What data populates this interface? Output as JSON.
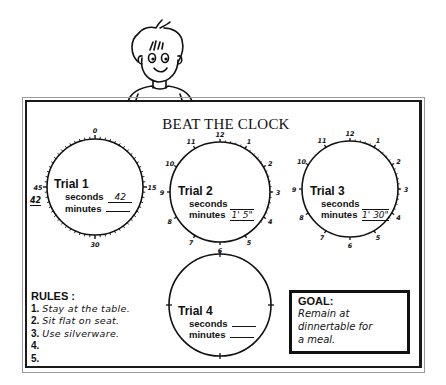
{
  "title": "BEAT THE CLOCK",
  "trials": [
    {
      "label": "Trial 1",
      "seconds_label": "seconds",
      "seconds_value": "42",
      "minutes_label": "minutes",
      "minutes_value": "",
      "face_numbers": [
        "0",
        "15",
        "30",
        "45"
      ],
      "annotation": "42"
    },
    {
      "label": "Trial 2",
      "seconds_label": "seconds",
      "seconds_value": "",
      "minutes_label": "minutes",
      "minutes_value": "1' 5\"",
      "face_numbers": [
        "12",
        "1",
        "2",
        "3",
        "4",
        "5",
        "6",
        "7",
        "8",
        "9",
        "10",
        "11"
      ]
    },
    {
      "label": "Trial 3",
      "seconds_label": "seconds",
      "seconds_value": "",
      "minutes_label": "minutes",
      "minutes_value": "1' 30\"",
      "face_numbers": [
        "12",
        "1",
        "2",
        "3",
        "4",
        "5",
        "6",
        "7",
        "8",
        "9",
        "10",
        "11"
      ]
    },
    {
      "label": "Trial 4",
      "seconds_label": "seconds",
      "seconds_value": "",
      "minutes_label": "minutes",
      "minutes_value": ""
    }
  ],
  "rules": {
    "title": "RULES :",
    "items": [
      {
        "num": "1.",
        "text": "Stay at the table."
      },
      {
        "num": "2.",
        "text": "Sit flat on seat."
      },
      {
        "num": "3.",
        "text": "Use silverware."
      },
      {
        "num": "4.",
        "text": ""
      },
      {
        "num": "5.",
        "text": ""
      }
    ]
  },
  "goal": {
    "title": "GOAL:",
    "lines": [
      "Remain at",
      "dinnertable for",
      "a meal."
    ]
  }
}
